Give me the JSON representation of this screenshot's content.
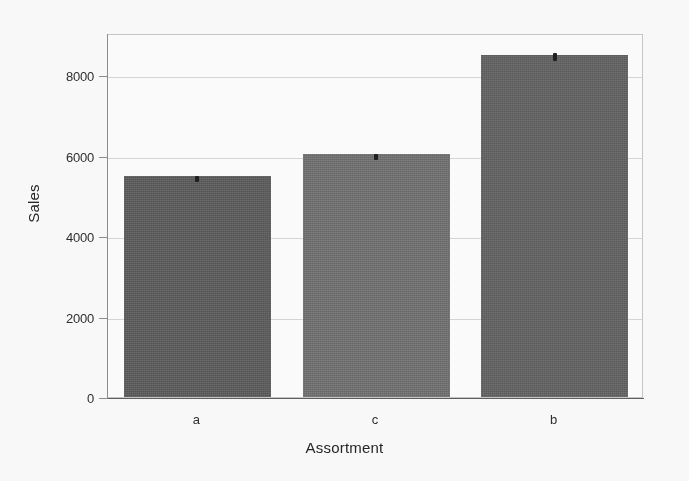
{
  "chart_data": {
    "type": "bar",
    "title": "",
    "xlabel": "Assortment",
    "ylabel": "Sales",
    "categories": [
      "a",
      "c",
      "b"
    ],
    "values": [
      5495,
      6030,
      8505
    ],
    "errors": [
      60,
      70,
      90
    ],
    "ylim": [
      0,
      9050
    ],
    "yticks": [
      0,
      2000,
      4000,
      6000,
      8000
    ],
    "ytick_labels": [
      "0",
      "2000",
      "4000",
      "6000",
      "8000"
    ],
    "grid": true,
    "legend": "none",
    "bar_colors": [
      "#5a5a5a",
      "#707070",
      "#616161"
    ],
    "error_color": "#1c1c1c",
    "gridline_color": "#d8d8d8",
    "axis_color": "#8d8d8d",
    "background": "#ffffff"
  },
  "axis": {
    "y_title": "Sales",
    "x_title": "Assortment"
  }
}
